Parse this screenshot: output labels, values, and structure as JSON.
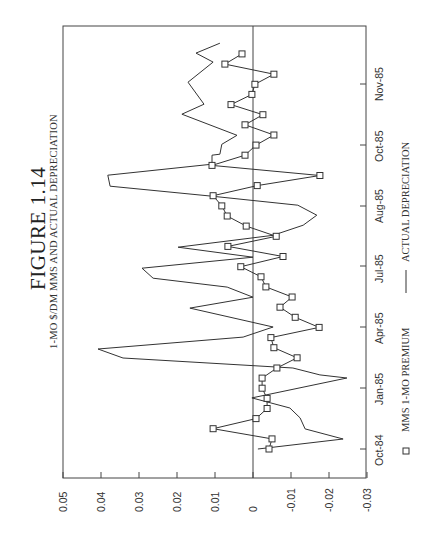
{
  "figure": {
    "title": "FIGURE 1.14",
    "subtitle": "1-MO $/DM MMS AND ACTUAL DEPRECIATION"
  },
  "legend": {
    "items": [
      {
        "marker": "square",
        "label": "MMS 1-MO PREMIUM"
      },
      {
        "marker": "line",
        "label": "ACTUAL DEPRECIATION"
      }
    ]
  },
  "axes": {
    "value_ticks": [
      "0.05",
      "0.04",
      "0.03",
      "0.02",
      "0.01",
      "0",
      "-0.01",
      "-0.02",
      "-0.03"
    ],
    "date_ticks": [
      "Oct-84",
      "Jan-85",
      "Apr-85",
      "Jul-85",
      "Aug-85",
      "Oct-85",
      "Nov-85"
    ]
  },
  "colors": {
    "ink": "#333333",
    "background": "#ffffff"
  },
  "chart_data": {
    "type": "line",
    "title": "FIGURE 1.14",
    "subtitle": "1-MO $/DM MMS AND ACTUAL DEPRECIATION",
    "orientation": "rotated 90° counter-clockwise (time runs bottom to top, values left=positive to right=negative)",
    "xlabel": "",
    "ylabel": "",
    "ylim": [
      -0.03,
      0.05
    ],
    "yticks": [
      0.05,
      0.04,
      0.03,
      0.02,
      0.01,
      0,
      -0.01,
      -0.02,
      -0.03
    ],
    "xtick_labels": [
      "Oct-84",
      "Jan-85",
      "Apr-85",
      "Jul-85",
      "Aug-85",
      "Oct-85",
      "Nov-85"
    ],
    "xtick_positions": [
      0,
      6,
      12,
      18,
      24,
      30,
      36
    ],
    "zero_line": true,
    "grid": false,
    "legend_position": "bottom",
    "series": [
      {
        "name": "MMS 1-MO PREMIUM",
        "style": "line with square markers",
        "x": [
          0,
          1,
          2,
          3,
          4,
          5,
          6,
          7,
          8,
          9,
          10,
          11,
          12,
          13,
          14,
          15,
          16,
          17,
          18,
          19,
          20,
          21,
          22,
          23,
          24,
          25,
          26,
          27,
          28,
          29,
          30,
          31,
          32,
          33,
          34,
          35,
          36,
          37,
          38,
          39
        ],
        "values": [
          -0.0042,
          -0.005,
          0.0105,
          -0.0008,
          -0.0037,
          -0.0037,
          -0.0024,
          -0.0024,
          -0.0063,
          -0.0116,
          -0.0055,
          -0.0047,
          -0.0174,
          -0.0111,
          -0.0071,
          -0.0103,
          -0.0034,
          -0.0021,
          0.0032,
          -0.0079,
          0.0066,
          -0.0061,
          0.0018,
          0.0068,
          0.0082,
          0.0105,
          -0.0011,
          -0.0176,
          0.0108,
          0.0021,
          -0.0008,
          -0.0055,
          0.0021,
          -0.0026,
          0.0058,
          0.0003,
          -0.0005,
          -0.0055,
          0.0074,
          0.0029
        ]
      },
      {
        "name": "ACTUAL DEPRECIATION",
        "style": "line",
        "x": [
          0,
          0.99,
          1.98,
          3.07,
          4.05,
          5.04,
          7.01,
          7.31,
          8.0,
          8.98,
          9.87,
          11.05,
          12.04,
          13.91,
          14.99,
          15.98,
          16.86,
          17.85,
          18.93,
          19.92,
          21.1,
          22.09,
          23.08,
          24.07,
          24.95,
          25.94,
          27.03,
          28.11,
          29.0,
          29.1,
          30.08,
          30.97,
          33.05,
          34.04,
          36.21,
          38.19,
          39.08,
          40.06
        ],
        "values": [
          -0.0013,
          -0.0237,
          -0.0137,
          -0.0124,
          -0.0097,
          0.0003,
          -0.0247,
          -0.0176,
          -0.0105,
          0.0342,
          0.0408,
          0.0026,
          -0.0053,
          0.0166,
          0,
          0.0068,
          0.0263,
          0.0292,
          0,
          0.0197,
          -0.0053,
          -0.0132,
          -0.0168,
          -0.0118,
          0.0105,
          0.0376,
          0.0382,
          0.0108,
          0.0108,
          0.0087,
          0.0082,
          0.0042,
          0.0187,
          0.0129,
          0.0171,
          0.0105,
          0.015,
          0.0087
        ]
      }
    ]
  }
}
